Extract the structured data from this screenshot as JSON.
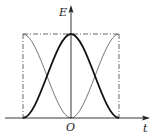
{
  "diagram": {
    "axes": {
      "y_label": "E",
      "x_label": "t",
      "origin_label": "O"
    },
    "curves": [
      {
        "name": "thick-bell-curve",
        "style": "solid-thick",
        "description": "rises from 0 at left boundary to max at origin, falls to 0 at right boundary"
      },
      {
        "name": "thin-inverted-curve",
        "style": "solid-thin",
        "description": "max at left boundary, 0 at origin, max at right boundary"
      }
    ],
    "guides": {
      "top_line": "dash-dot",
      "left_line": "dash-dot",
      "right_line": "dash-dot"
    },
    "colors": {
      "ink": "#222222",
      "thin_ink": "#555555",
      "background": "#ffffff"
    }
  }
}
